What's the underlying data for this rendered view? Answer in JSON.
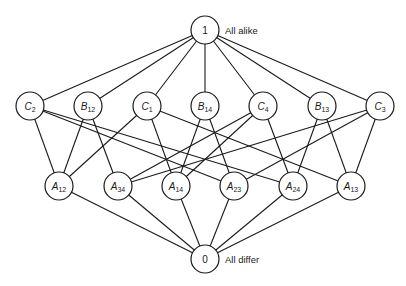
{
  "diagram": {
    "type": "lattice",
    "node_radius": 14,
    "nodes": [
      {
        "id": "1",
        "main": "1",
        "sub": "",
        "x": 205,
        "y": 30,
        "italic": false,
        "annotation": "All alike"
      },
      {
        "id": "C2",
        "main": "C",
        "sub": "2",
        "x": 30,
        "y": 106,
        "italic": true
      },
      {
        "id": "B12",
        "main": "B",
        "sub": "12",
        "x": 88,
        "y": 106,
        "italic": true
      },
      {
        "id": "C1",
        "main": "C",
        "sub": "1",
        "x": 147,
        "y": 106,
        "italic": true
      },
      {
        "id": "B14",
        "main": "B",
        "sub": "14",
        "x": 205,
        "y": 106,
        "italic": true
      },
      {
        "id": "C4",
        "main": "C",
        "sub": "4",
        "x": 263,
        "y": 106,
        "italic": true
      },
      {
        "id": "B13",
        "main": "B",
        "sub": "13",
        "x": 322,
        "y": 106,
        "italic": true
      },
      {
        "id": "C3",
        "main": "C",
        "sub": "3",
        "x": 380,
        "y": 106,
        "italic": true
      },
      {
        "id": "A12",
        "main": "A",
        "sub": "12",
        "x": 59,
        "y": 186,
        "italic": true
      },
      {
        "id": "A34",
        "main": "A",
        "sub": "34",
        "x": 118,
        "y": 186,
        "italic": true
      },
      {
        "id": "A14",
        "main": "A",
        "sub": "14",
        "x": 176,
        "y": 186,
        "italic": true
      },
      {
        "id": "A23",
        "main": "A",
        "sub": "23",
        "x": 234,
        "y": 186,
        "italic": true
      },
      {
        "id": "A24",
        "main": "A",
        "sub": "24",
        "x": 293,
        "y": 186,
        "italic": true
      },
      {
        "id": "A13",
        "main": "A",
        "sub": "13",
        "x": 351,
        "y": 186,
        "italic": true
      },
      {
        "id": "0",
        "main": "0",
        "sub": "",
        "x": 205,
        "y": 259,
        "italic": false,
        "annotation": "All differ"
      }
    ],
    "edges": [
      [
        "1",
        "C2"
      ],
      [
        "1",
        "B12"
      ],
      [
        "1",
        "C1"
      ],
      [
        "1",
        "B14"
      ],
      [
        "1",
        "C4"
      ],
      [
        "1",
        "B13"
      ],
      [
        "1",
        "C3"
      ],
      [
        "C2",
        "A12"
      ],
      [
        "C2",
        "A23"
      ],
      [
        "C2",
        "A24"
      ],
      [
        "B12",
        "A12"
      ],
      [
        "B12",
        "A34"
      ],
      [
        "C1",
        "A12"
      ],
      [
        "C1",
        "A14"
      ],
      [
        "C1",
        "A13"
      ],
      [
        "B14",
        "A14"
      ],
      [
        "B14",
        "A23"
      ],
      [
        "C4",
        "A34"
      ],
      [
        "C4",
        "A14"
      ],
      [
        "C4",
        "A24"
      ],
      [
        "B13",
        "A24"
      ],
      [
        "B13",
        "A13"
      ],
      [
        "C3",
        "A34"
      ],
      [
        "C3",
        "A23"
      ],
      [
        "C3",
        "A13"
      ],
      [
        "A12",
        "0"
      ],
      [
        "A34",
        "0"
      ],
      [
        "A14",
        "0"
      ],
      [
        "A23",
        "0"
      ],
      [
        "A24",
        "0"
      ],
      [
        "A13",
        "0"
      ]
    ]
  },
  "labels": {
    "top": "All alike",
    "bottom": "All differ"
  }
}
